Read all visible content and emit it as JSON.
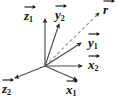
{
  "figure": {
    "kind": "vector-coordinate-frame-diagram",
    "width": 119,
    "height": 104,
    "background_color": "#ffffff",
    "line_color": "#3a3a3a",
    "label_color": "#111111",
    "origin": {
      "x": 45,
      "y": 66
    }
  },
  "vectors": [
    {
      "id": "z1",
      "symbol": "z",
      "subscript": "1",
      "label": "z1",
      "style": "solid",
      "from": {
        "x": 45,
        "y": 66
      },
      "to": {
        "x": 45,
        "y": 17
      },
      "label_pos": {
        "x": 24,
        "y": 10
      }
    },
    {
      "id": "y2",
      "symbol": "y",
      "subscript": "2",
      "label": "y2",
      "style": "solid",
      "from": {
        "x": 45,
        "y": 66
      },
      "to": {
        "x": 60,
        "y": 22
      },
      "label_pos": {
        "x": 54,
        "y": 8
      }
    },
    {
      "id": "r",
      "symbol": "r",
      "subscript": "",
      "label": "r",
      "style": "dashed",
      "from": {
        "x": 45,
        "y": 66
      },
      "to": {
        "x": 101,
        "y": 11
      },
      "label_pos": {
        "x": 101,
        "y": 3
      }
    },
    {
      "id": "y1",
      "symbol": "y",
      "subscript": "1",
      "label": "y1",
      "style": "solid",
      "from": {
        "x": 45,
        "y": 66
      },
      "to": {
        "x": 83,
        "y": 41
      },
      "label_pos": {
        "x": 85,
        "y": 36
      }
    },
    {
      "id": "x2",
      "symbol": "x",
      "subscript": "2",
      "label": "x2",
      "style": "solid",
      "from": {
        "x": 45,
        "y": 66
      },
      "to": {
        "x": 84,
        "y": 66
      },
      "label_pos": {
        "x": 87,
        "y": 60
      }
    },
    {
      "id": "x1",
      "symbol": "x",
      "subscript": "1",
      "label": "x1",
      "style": "solid",
      "from": {
        "x": 45,
        "y": 66
      },
      "to": {
        "x": 79,
        "y": 81
      },
      "label_pos": {
        "x": 67,
        "y": 83
      }
    },
    {
      "id": "z2",
      "symbol": "z",
      "subscript": "2",
      "label": "z2",
      "style": "solid",
      "from": {
        "x": 45,
        "y": 66
      },
      "to": {
        "x": 13,
        "y": 79
      },
      "label_pos": {
        "x": 3,
        "y": 82
      }
    }
  ],
  "labels": {
    "z1": {
      "symbol": "z",
      "subscript": "1"
    },
    "y2": {
      "symbol": "y",
      "subscript": "2"
    },
    "r": {
      "symbol": "r",
      "subscript": ""
    },
    "y1": {
      "symbol": "y",
      "subscript": "1"
    },
    "x2": {
      "symbol": "x",
      "subscript": "2"
    },
    "x1": {
      "symbol": "x",
      "subscript": "1"
    },
    "z2": {
      "symbol": "z",
      "subscript": "2"
    }
  }
}
